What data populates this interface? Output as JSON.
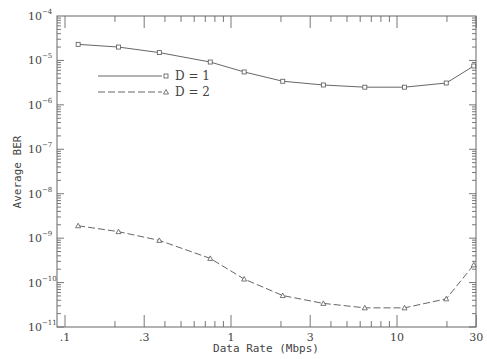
{
  "chart_data": {
    "type": "line",
    "title": "",
    "xlabel": "Data Rate (Mbps)",
    "ylabel": "Average BER",
    "xscale": "log",
    "yscale": "log",
    "xlim": [
      0.09,
      31
    ],
    "ylim": [
      1e-11,
      0.0001
    ],
    "x_tick_labels": [
      ".1",
      ".3",
      "1",
      "3",
      "10",
      "30"
    ],
    "x_ticks": [
      0.1,
      0.3,
      1,
      3,
      10,
      30
    ],
    "y_tick_labels": [
      "10^-4",
      "10^-5",
      "10^-6",
      "10^-7",
      "10^-8",
      "10^-9",
      "10^-10",
      "10^-11"
    ],
    "y_ticks_exp": [
      -4,
      -5,
      -6,
      -7,
      -8,
      -9,
      -10,
      -11
    ],
    "grid": false,
    "legend_position": "upper-left-inside",
    "series": [
      {
        "name": "D = 1",
        "marker": "square",
        "linestyle": "solid",
        "x": [
          0.12,
          0.21,
          0.37,
          0.75,
          1.2,
          2.05,
          3.6,
          6.4,
          11.1,
          19.8,
          29
        ],
        "values": [
          2.3e-05,
          2e-05,
          1.5e-05,
          9.2e-06,
          5.5e-06,
          3.4e-06,
          2.8e-06,
          2.5e-06,
          2.5e-06,
          3.1e-06,
          7.5e-06
        ]
      },
      {
        "name": "D = 2",
        "marker": "triangle",
        "linestyle": "dashed",
        "x": [
          0.12,
          0.21,
          0.37,
          0.75,
          1.2,
          2.05,
          3.6,
          6.4,
          11.1,
          19.8,
          29
        ],
        "values": [
          1.9e-09,
          1.4e-09,
          8.9e-10,
          3.5e-10,
          1.2e-10,
          5.1e-11,
          3.4e-11,
          2.7e-11,
          2.7e-11,
          4.3e-11,
          2.5e-10
        ]
      }
    ]
  },
  "legend": {
    "items": [
      {
        "label": "D = 1"
      },
      {
        "label": "D = 2"
      }
    ]
  },
  "axes": {
    "xlabel": "Data Rate (Mbps)",
    "ylabel": "Average BER"
  }
}
